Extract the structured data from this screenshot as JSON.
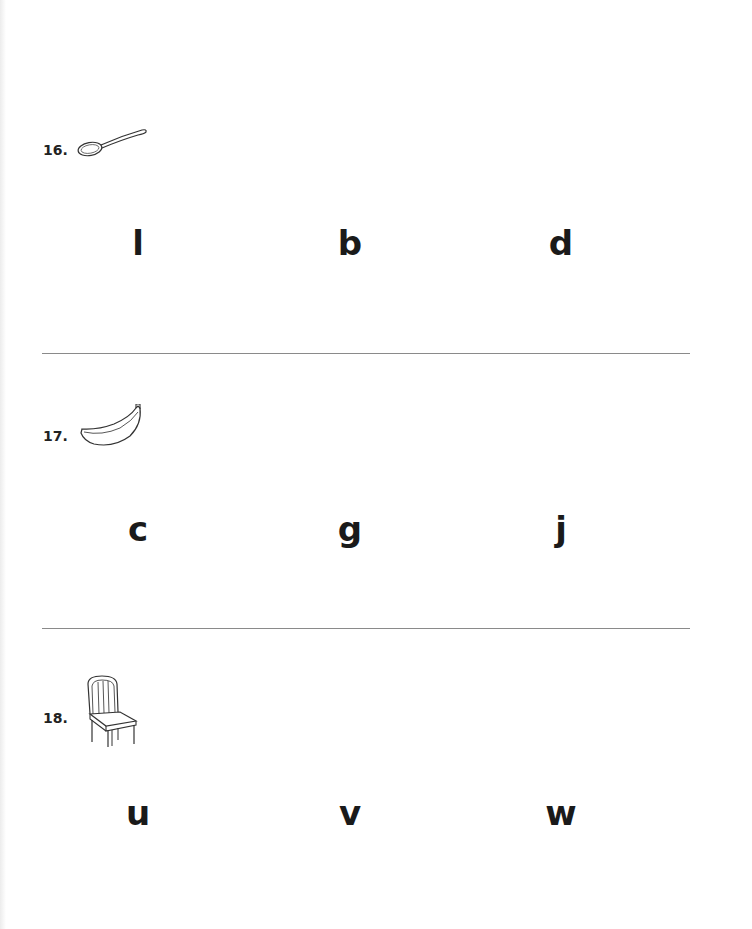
{
  "questions": [
    {
      "number": "16.",
      "picture": "spoon-icon",
      "choices": [
        "l",
        "b",
        "d"
      ]
    },
    {
      "number": "17.",
      "picture": "banana-icon",
      "choices": [
        "c",
        "g",
        "j"
      ]
    },
    {
      "number": "18.",
      "picture": "chair-icon",
      "choices": [
        "u",
        "v",
        "w"
      ]
    }
  ]
}
